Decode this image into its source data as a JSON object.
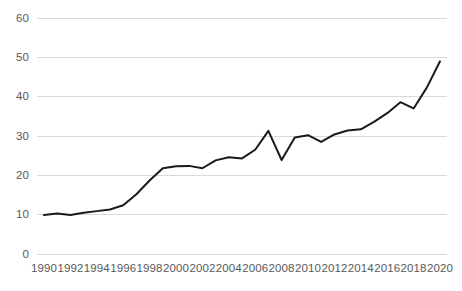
{
  "chart_data": {
    "type": "line",
    "title": "",
    "subtitle": "",
    "xlabel": "",
    "ylabel": "",
    "xlim": [
      1990,
      2020
    ],
    "ylim": [
      0,
      60
    ],
    "ytick_labels": [
      "60",
      "50",
      "40",
      "30",
      "20",
      "10",
      "0"
    ],
    "ytick_values": [
      60,
      50,
      40,
      30,
      20,
      10,
      0
    ],
    "xtick_labels": [
      "1990",
      "1992",
      "1994",
      "1996",
      "1998",
      "2000",
      "2002",
      "2004",
      "2006",
      "2008",
      "2010",
      "2012",
      "2014",
      "2016",
      "2018",
      "2020"
    ],
    "xtick_values": [
      1990,
      1992,
      1994,
      1996,
      1998,
      2000,
      2002,
      2004,
      2006,
      2008,
      2010,
      2012,
      2014,
      2016,
      2018,
      2020
    ],
    "grid": "horizontal",
    "legend": "none",
    "line_color": "#1a1a1a",
    "grid_color": "#d9d9d9",
    "background_color": "#ffffff",
    "tick_label_color": "#595959",
    "x": [
      1990,
      1991,
      1992,
      1993,
      1994,
      1995,
      1996,
      1997,
      1998,
      1999,
      2000,
      2001,
      2002,
      2003,
      2004,
      2005,
      2006,
      2007,
      2008,
      2009,
      2010,
      2011,
      2012,
      2013,
      2014,
      2015,
      2016,
      2017,
      2018,
      2019,
      2020
    ],
    "values": [
      9.9,
      10.3,
      9.9,
      10.5,
      10.9,
      11.3,
      12.4,
      15.2,
      18.7,
      21.8,
      22.3,
      22.4,
      21.8,
      23.8,
      24.6,
      24.3,
      26.5,
      31.3,
      23.9,
      29.6,
      30.2,
      28.5,
      30.4,
      31.4,
      31.7,
      33.6,
      35.8,
      38.6,
      37.0,
      42.3,
      49.0
    ],
    "series": [
      {
        "name": "series-1",
        "values": [
          9.9,
          10.3,
          9.9,
          10.5,
          10.9,
          11.3,
          12.4,
          15.2,
          18.7,
          21.8,
          22.3,
          22.4,
          21.8,
          23.8,
          24.6,
          24.3,
          26.5,
          31.3,
          23.9,
          29.6,
          30.2,
          28.5,
          30.4,
          31.4,
          31.7,
          33.6,
          35.8,
          38.6,
          37.0,
          42.3,
          49.0
        ]
      }
    ]
  }
}
